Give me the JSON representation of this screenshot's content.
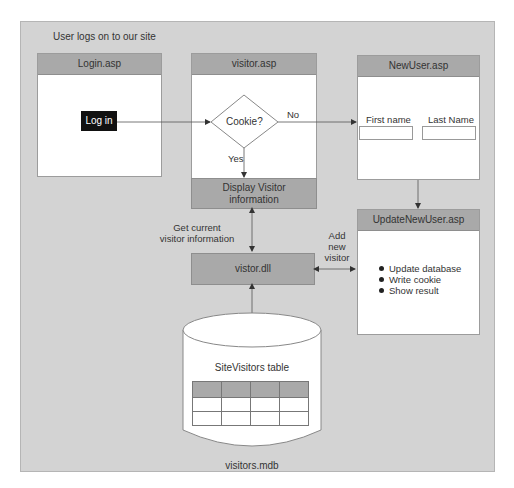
{
  "diagram": {
    "title": "User logs on to our site",
    "colors": {
      "panel_bg": "#d3d3d3",
      "box_header": "#a9a9a9",
      "box_bg": "#ffffff",
      "button_bg": "#111111",
      "line": "#555555"
    },
    "pages": {
      "login": {
        "title": "Login.asp",
        "button_label": "Log in"
      },
      "visitor": {
        "title": "visitor.asp",
        "decision_label": "Cookie?",
        "yes_label": "Yes",
        "no_label": "No",
        "display_box_line1": "Display Visitor",
        "display_box_line2": "information"
      },
      "new_user": {
        "title": "NewUser.asp",
        "first_name_label": "First name",
        "last_name_label": "Last Name",
        "first_name_value": "",
        "last_name_value": ""
      },
      "update_new_user": {
        "title": "UpdateNewUser.asp",
        "bullets": [
          "Update database",
          "Write cookie",
          "Show result"
        ]
      }
    },
    "component": {
      "title": "vistor.dll"
    },
    "edge_labels": {
      "get_current_line1": "Get current",
      "get_current_line2": "visitor information",
      "add_new_line1": "Add",
      "add_new_line2": "new",
      "add_new_line3": "visitor"
    },
    "database": {
      "table_label": "SiteVisitors table",
      "file_label": "visitors.mdb",
      "table_columns": 4,
      "table_rows": 3
    }
  }
}
